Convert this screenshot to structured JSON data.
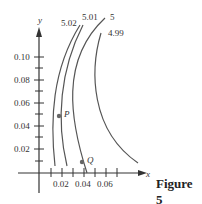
{
  "figure": {
    "caption": "Figure 5",
    "x_axis_label": "x",
    "y_axis_label": "y",
    "x_ticks": [
      "0.02",
      "0.04",
      "0.06"
    ],
    "y_ticks": [
      "0.10",
      "0.08",
      "0.06",
      "0.04",
      "0.02"
    ],
    "curve_labels": [
      "5.02",
      "5.01",
      "5",
      "4.99"
    ],
    "points": [
      {
        "label": "P",
        "x": 0.017,
        "y": 0.048
      },
      {
        "label": "Q",
        "x": 0.039,
        "y": 0.01
      }
    ],
    "colors": {
      "curve": "#555555",
      "axis": "#333333",
      "point": "#666666"
    }
  }
}
